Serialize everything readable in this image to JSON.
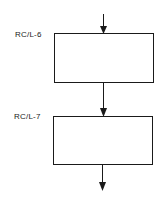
{
  "diagram": {
    "type": "flowchart",
    "blocks": [
      {
        "label": "RC/L-6"
      },
      {
        "label": "RC/L-7"
      }
    ],
    "colors": {
      "line": "#1a1a1a",
      "background": "#ffffff"
    }
  }
}
